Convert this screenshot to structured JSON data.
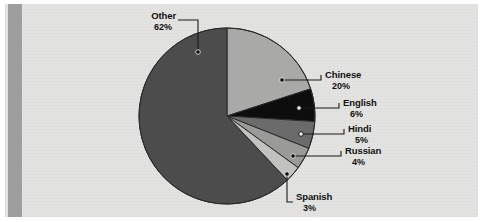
{
  "chart_data": {
    "type": "pie",
    "title": "",
    "categories": [
      "Chinese",
      "English",
      "Hindi",
      "Russian",
      "Spanish",
      "Other"
    ],
    "values": [
      20,
      6,
      5,
      4,
      3,
      62
    ],
    "value_labels": [
      "20%",
      "6%",
      "5%",
      "4%",
      "3%",
      "62%"
    ],
    "unit": "%",
    "legend": "callout-labels",
    "grid": false,
    "slices": [
      {
        "label": "Chinese",
        "percent": 20,
        "percent_label": "20%",
        "color": "#a9a9a7",
        "start_deg": 0,
        "end_deg": 72
      },
      {
        "label": "English",
        "percent": 6,
        "percent_label": "6%",
        "color": "#0d0d0d",
        "start_deg": 72,
        "end_deg": 93.6
      },
      {
        "label": "Hindi",
        "percent": 5,
        "percent_label": "5%",
        "color": "#6b6b6b",
        "start_deg": 93.6,
        "end_deg": 111.6
      },
      {
        "label": "Russian",
        "percent": 4,
        "percent_label": "4%",
        "color": "#9a9a98",
        "start_deg": 111.6,
        "end_deg": 126
      },
      {
        "label": "Spanish",
        "percent": 3,
        "percent_label": "3%",
        "color": "#c2c2c0",
        "start_deg": 126,
        "end_deg": 136.8
      },
      {
        "label": "Other",
        "percent": 62,
        "percent_label": "62%",
        "color": "#4c4c4c",
        "start_deg": 136.8,
        "end_deg": 360
      }
    ]
  },
  "colors": {
    "page_background": "#e3e3e1",
    "gutter_bar": "#9e9e9e",
    "outline": "#2b2b2b",
    "text": "#111111",
    "leader_line": "#1a1a1a",
    "marker_dot": "#111111",
    "marker_dot_light": "#f0f0f0"
  },
  "callouts": {
    "chinese": {
      "label": "Chinese",
      "percent_label": "20%"
    },
    "english": {
      "label": "English",
      "percent_label": "6%"
    },
    "hindi": {
      "label": "Hindi",
      "percent_label": "5%"
    },
    "russian": {
      "label": "Russian",
      "percent_label": "4%"
    },
    "spanish": {
      "label": "Spanish",
      "percent_label": "3%"
    },
    "other": {
      "label": "Other",
      "percent_label": "62%"
    }
  }
}
